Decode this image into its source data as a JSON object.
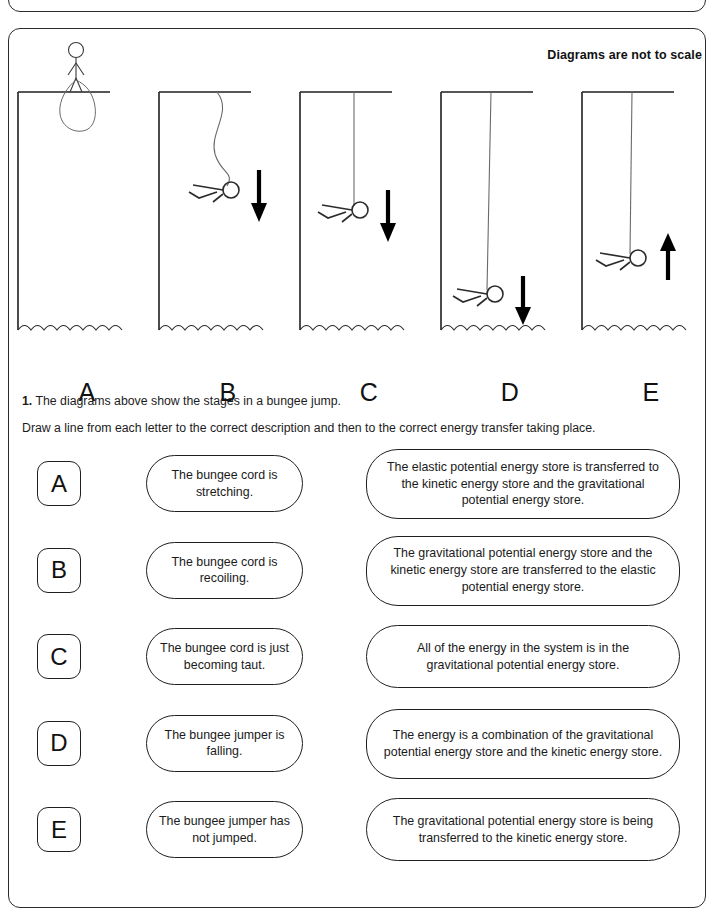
{
  "page": {
    "scale_note": "Diagrams are not to scale"
  },
  "diagrams": {
    "items": [
      {
        "letter": "A",
        "stage": "standing-on-platform",
        "cord": "coiled",
        "arrow": "none"
      },
      {
        "letter": "B",
        "stage": "falling-slack-cord",
        "cord": "slack-s-curve",
        "arrow": "down"
      },
      {
        "letter": "C",
        "stage": "cord-becoming-taut",
        "cord": "straight",
        "arrow": "down"
      },
      {
        "letter": "D",
        "stage": "cord-stretching-near-water",
        "cord": "stretched",
        "arrow": "down"
      },
      {
        "letter": "E",
        "stage": "cord-recoiling-upward",
        "cord": "recoiling",
        "arrow": "up"
      }
    ]
  },
  "question": {
    "number": "1.",
    "line1": "The diagrams above show the stages in a bungee jump.",
    "line2": "Draw a line from each letter to the correct description and then to the correct energy transfer taking place."
  },
  "match": {
    "letters": [
      "A",
      "B",
      "C",
      "D",
      "E"
    ],
    "descriptions": [
      "The bungee cord is stretching.",
      "The bungee cord is recoiling.",
      "The bungee cord is just becoming taut.",
      "The bungee jumper is falling.",
      "The bungee jumper has not jumped."
    ],
    "energy_transfers": [
      "The elastic potential energy store is transferred to the kinetic energy store and the gravitational potential energy store.",
      "The gravitational potential energy store and the kinetic energy store are transferred to the elastic potential energy store.",
      "All of the energy in the system is in the gravitational potential energy store.",
      "The energy is a combination of the gravitational potential energy store and the kinetic energy store.",
      "The gravitational potential energy store is being transferred to the kinetic energy store."
    ]
  },
  "colors": {
    "ink": "#1a1a1a",
    "line": "#2b2b2b",
    "paper": "#ffffff"
  }
}
